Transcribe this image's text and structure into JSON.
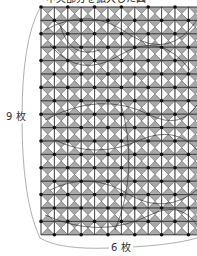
{
  "title": "中央部分を拡大した図",
  "labels": {
    "rows": "9 枚",
    "cols": "6 枚"
  },
  "grid": {
    "origin_x": 41,
    "origin_y": 7,
    "cell": 13.4,
    "columns": 12,
    "rows": 17,
    "pattern": "pinwheel-triangles"
  },
  "colors": {
    "gray_triangle": "#a9a9a9",
    "white_triangle": "#ffffff",
    "grid_line": "#333333",
    "dot": "#111111",
    "curve": "#222222",
    "bracket": "#999999"
  }
}
